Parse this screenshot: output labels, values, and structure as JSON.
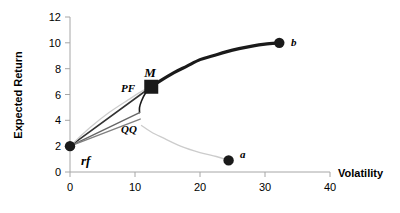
{
  "chart_data": {
    "type": "line",
    "title": "",
    "xlabel": "Volatility",
    "ylabel": "Expected Return",
    "xlim": [
      0,
      40
    ],
    "ylim": [
      0,
      12
    ],
    "xticks": [
      0,
      10,
      20,
      30,
      40
    ],
    "yticks": [
      0,
      2,
      4,
      6,
      8,
      10,
      12
    ],
    "grid": false,
    "legend": "none",
    "points": [
      {
        "name": "rf",
        "label": "rf",
        "x": 0,
        "y": 2.0,
        "marker": "circle",
        "color": "#1a1a1a"
      },
      {
        "name": "M",
        "label": "M",
        "x": 12.5,
        "y": 6.6,
        "marker": "square",
        "color": "#1a1a1a"
      },
      {
        "name": "a",
        "label": "a",
        "x": 24.4,
        "y": 0.9,
        "marker": "circle",
        "color": "#1a1a1a"
      },
      {
        "name": "b",
        "label": "b",
        "x": 32.2,
        "y": 10.0,
        "marker": "circle",
        "color": "#1a1a1a"
      }
    ],
    "annotations": [
      {
        "name": "PF",
        "label": "PF",
        "x": 10.5,
        "y": 6.7
      },
      {
        "name": "QQ",
        "label": "QQ",
        "x": 11.0,
        "y": 3.6
      }
    ],
    "series": [
      {
        "name": "efficient-frontier",
        "style": "solid-thick-black",
        "color": "#1a1a1a",
        "points": [
          [
            12.5,
            6.6
          ],
          [
            14.0,
            7.1
          ],
          [
            16.0,
            7.7
          ],
          [
            18.0,
            8.2
          ],
          [
            20.0,
            8.7
          ],
          [
            22.0,
            9.0
          ],
          [
            24.0,
            9.3
          ],
          [
            26.0,
            9.55
          ],
          [
            28.0,
            9.75
          ],
          [
            30.0,
            9.9
          ],
          [
            32.2,
            10.0
          ]
        ]
      },
      {
        "name": "frontier-lower-branch",
        "style": "solid-thin-black",
        "color": "#1a1a1a",
        "points": [
          [
            12.5,
            6.6
          ],
          [
            11.6,
            6.1
          ],
          [
            11.0,
            5.5
          ],
          [
            10.7,
            5.0
          ],
          [
            10.7,
            4.6
          ]
        ]
      },
      {
        "name": "cal-upper-to-M",
        "style": "solid-thin-black",
        "color": "#333333",
        "points": [
          [
            0,
            2.0
          ],
          [
            12.5,
            6.6
          ]
        ]
      },
      {
        "name": "cal-middle",
        "style": "solid-thin-gray",
        "color": "#666666",
        "points": [
          [
            0,
            2.0
          ],
          [
            10.7,
            4.6
          ]
        ]
      },
      {
        "name": "cal-lower",
        "style": "solid-thin-gray",
        "color": "#808080",
        "points": [
          [
            0,
            2.0
          ],
          [
            10.8,
            4.1
          ]
        ]
      },
      {
        "name": "asset-frontier-light",
        "style": "solid-thin-lightgray",
        "color": "#cccccc",
        "points": [
          [
            0,
            2.0
          ],
          [
            3.0,
            3.4
          ],
          [
            6.0,
            4.6
          ],
          [
            9.0,
            5.6
          ],
          [
            11.2,
            6.3
          ],
          [
            12.5,
            6.6
          ]
        ]
      },
      {
        "name": "inefficient-branch-to-a",
        "style": "solid-thin-lightgray",
        "color": "#cccccc",
        "points": [
          [
            11.0,
            3.6
          ],
          [
            12.5,
            3.1
          ],
          [
            14.5,
            2.6
          ],
          [
            17.0,
            2.0
          ],
          [
            20.0,
            1.5
          ],
          [
            22.5,
            1.2
          ],
          [
            24.4,
            0.9
          ]
        ]
      }
    ]
  },
  "axes": {
    "x_title": "Volatility",
    "y_title": "Expected Return",
    "x_tick_labels": [
      "0",
      "10",
      "20",
      "30",
      "40"
    ],
    "y_tick_labels": [
      "0",
      "2",
      "4",
      "6",
      "8",
      "10",
      "12"
    ]
  },
  "labels": {
    "rf": "rf",
    "M": "M",
    "PF": "PF",
    "QQ": "QQ",
    "a": "a",
    "b": "b"
  },
  "colors": {
    "axis": "#a6a6a6",
    "text": "#000000",
    "dark_line": "#1a1a1a",
    "light_line": "#cccccc",
    "mid_line": "#707070"
  }
}
